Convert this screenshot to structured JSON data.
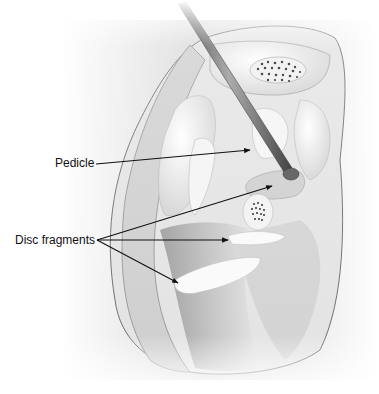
{
  "figure": {
    "labels": [
      {
        "id": "pedicle",
        "text": "Pedicle",
        "x": 55,
        "y": 156
      },
      {
        "id": "disc-fragments",
        "text": "Disc fragments",
        "x": 15,
        "y": 233
      }
    ],
    "colors": {
      "background": "#ffffff",
      "bone_light": "#f2f2f2",
      "bone_mid": "#d9d9d9",
      "canal_dark": "#9a9a9a",
      "outline": "#6e6e6e",
      "leader_line": "#111111",
      "instrument": "#3a3a3a"
    }
  }
}
